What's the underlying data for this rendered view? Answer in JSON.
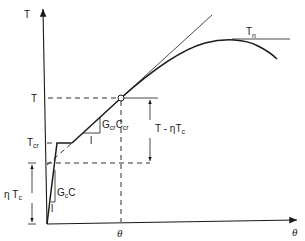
{
  "diagram": {
    "axes": {
      "y_label": "T",
      "x_label": "θ"
    },
    "labels": {
      "T_level": "T",
      "T_cr": "T",
      "T_cr_sub": "cr",
      "eta_Tc": "η T",
      "eta_Tc_sub": "c",
      "theta_marker": "θ",
      "T_n": "T",
      "T_n_sub": "n",
      "slope_cracked": "G",
      "slope_cracked_sub1": "cr",
      "slope_cracked_mid": "C",
      "slope_cracked_sub2": "cr",
      "slope_uncracked": "G",
      "slope_uncracked_sub": "c",
      "slope_uncracked_tail": "C",
      "unit_run_cracked": "l",
      "unit_run_uncracked": "l",
      "dimension_upper": "T - ηT",
      "dimension_upper_sub": "c"
    },
    "colors": {
      "ink": "#1a1a1a",
      "background": "#ffffff"
    }
  }
}
